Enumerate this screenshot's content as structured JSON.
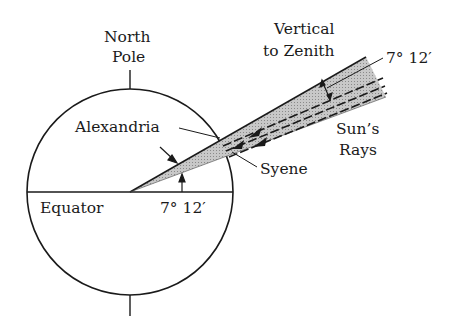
{
  "diagram": {
    "labels": {
      "north_pole_line1": "North",
      "north_pole_line2": "Pole",
      "vertical_line1": "Vertical",
      "vertical_line2": "to Zenith",
      "angle_top": "7° 12′",
      "alexandria": "Alexandria",
      "syene": "Syene",
      "suns_rays_line1": "Sun’s",
      "suns_rays_line2": "Rays",
      "equator": "Equator",
      "angle_center": "7° 12′"
    },
    "colors": {
      "stroke": "#1a1a1a",
      "wedge_fill": "#bdbdbd",
      "background": "#ffffff"
    }
  }
}
